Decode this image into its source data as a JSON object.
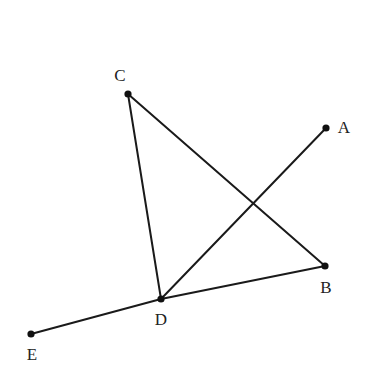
{
  "diagram": {
    "type": "geometry",
    "stroke_color": "#1a1a1a",
    "point_color": "#111111",
    "points": [
      {
        "id": "A",
        "label": "A",
        "x": 326,
        "y": 128,
        "label_x": 344,
        "label_y": 127
      },
      {
        "id": "B",
        "label": "B",
        "x": 325,
        "y": 266,
        "label_x": 326,
        "label_y": 287
      },
      {
        "id": "C",
        "label": "C",
        "x": 128,
        "y": 94,
        "label_x": 120,
        "label_y": 75
      },
      {
        "id": "D",
        "label": "D",
        "x": 161,
        "y": 299,
        "label_x": 161,
        "label_y": 319
      },
      {
        "id": "E",
        "label": "E",
        "x": 31,
        "y": 334,
        "label_x": 32,
        "label_y": 354
      }
    ],
    "segments": [
      {
        "from": "C",
        "to": "D"
      },
      {
        "from": "C",
        "to": "B"
      },
      {
        "from": "D",
        "to": "A"
      },
      {
        "from": "E",
        "to": "D"
      },
      {
        "from": "D",
        "to": "B"
      }
    ],
    "labels": {
      "A": "A",
      "B": "B",
      "C": "C",
      "D": "D",
      "E": "E"
    }
  }
}
